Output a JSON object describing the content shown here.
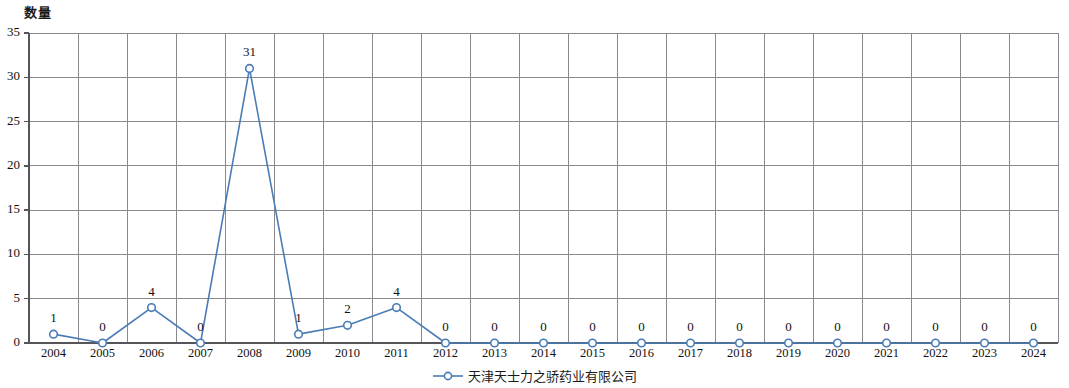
{
  "chart_data": {
    "type": "line",
    "title": "",
    "ylabel": "数量",
    "xlabel": "",
    "ylim": [
      0,
      35
    ],
    "y_ticks": [
      "0",
      "5",
      "10",
      "15",
      "20",
      "25",
      "30",
      "35"
    ],
    "grid": true,
    "legend_position": "bottom-center",
    "series": [
      {
        "name": "天津天士力之骄药业有限公司",
        "color": "#4a7cb5",
        "marker": "open-circle",
        "values": [
          1,
          0,
          4,
          0,
          31,
          1,
          2,
          4,
          0,
          0,
          0,
          0,
          0,
          0,
          0,
          0,
          0,
          0,
          0,
          0,
          0
        ]
      }
    ],
    "categories": [
      "2004",
      "2005",
      "2006",
      "2007",
      "2008",
      "2009",
      "2010",
      "2011",
      "2012",
      "2013",
      "2014",
      "2015",
      "2016",
      "2017",
      "2018",
      "2019",
      "2020",
      "2021",
      "2022",
      "2023",
      "2024"
    ],
    "data_labels": [
      "1",
      "0",
      "4",
      "0",
      "31",
      "1",
      "2",
      "4",
      "0",
      "0",
      "0",
      "0",
      "0",
      "0",
      "0",
      "0",
      "0",
      "0",
      "0",
      "0",
      "0"
    ],
    "axis_color": "#55555a",
    "grid_color": "#8a8a8e"
  },
  "legend": {
    "entries": [
      {
        "label": "天津天士力之骄药业有限公司",
        "color": "#4a7cb5"
      }
    ]
  }
}
